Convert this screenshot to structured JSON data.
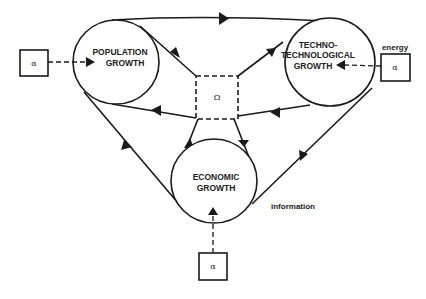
{
  "diagram": {
    "nodes": {
      "population": {
        "line1": "POPULATION",
        "line2": "GROWTH"
      },
      "techno": {
        "line1": "TECHNO-",
        "line2": "TECHNOLOGICAL",
        "line3": "GROWTH"
      },
      "economic": {
        "line1": "ECONOMIC",
        "line2": "GROWTH"
      },
      "omega": {
        "symbol": "Ω"
      }
    },
    "inputs": {
      "left": {
        "symbol": "α"
      },
      "right": {
        "symbol": "α",
        "label": "energy"
      },
      "bottom": {
        "symbol": "α"
      }
    },
    "edge_labels": {
      "information": "information"
    },
    "colors": {
      "line": "#1a1a1a",
      "background": "#ffffff"
    }
  }
}
